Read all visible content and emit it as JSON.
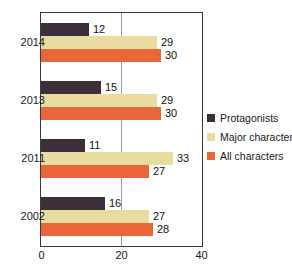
{
  "chart_data": {
    "type": "bar",
    "orientation": "horizontal",
    "title": "",
    "xlabel": "",
    "ylabel": "",
    "categories": [
      "2014",
      "2013",
      "2011",
      "2002"
    ],
    "series": [
      {
        "name": "Protagonists",
        "color": "#3d2f3a",
        "values": [
          12,
          15,
          11,
          16
        ]
      },
      {
        "name": "Major characters",
        "color": "#e8dca0",
        "values": [
          29,
          29,
          33,
          27
        ]
      },
      {
        "name": "All characters",
        "color": "#e8663a",
        "values": [
          30,
          30,
          27,
          28
        ]
      }
    ],
    "xlim": [
      0,
      40
    ],
    "xticks": [
      "0",
      "20",
      "40"
    ],
    "xtick_values": [
      0,
      20,
      40
    ],
    "gridlines": [
      20
    ],
    "grid": true,
    "legend_position": "right",
    "data_labels": true,
    "frame_color": "#3a3a3a",
    "background": "#ffffff"
  },
  "legend": {
    "items": [
      {
        "label": "Protagonists",
        "color": "#3d2f3a"
      },
      {
        "label": "Major characters",
        "color": "#e8dca0"
      },
      {
        "label": "All characters",
        "color": "#e8663a"
      }
    ]
  }
}
